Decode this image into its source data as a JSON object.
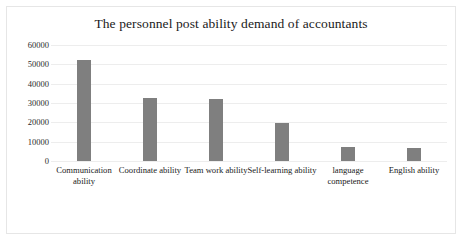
{
  "chart_data": {
    "type": "bar",
    "title": "The personnel post ability demand of accountants",
    "xlabel": "",
    "ylabel": "",
    "categories": [
      "Communication ability",
      "Coordinate ability",
      "Team work ability",
      "Self-learning ability",
      "language competence",
      "English ability"
    ],
    "values": [
      52000,
      32500,
      32000,
      19500,
      7000,
      6500
    ],
    "ylim": [
      0,
      60000
    ],
    "yticks": [
      0,
      10000,
      20000,
      30000,
      40000,
      50000,
      60000
    ],
    "ytick_labels": [
      "0",
      "10000",
      "20000",
      "30000",
      "40000",
      "50000",
      "60000"
    ],
    "grid": true,
    "legend": false,
    "bar_color": "#7f7f7f",
    "gridline_color": "#ededed",
    "frame_color": "#e6e6e6"
  }
}
